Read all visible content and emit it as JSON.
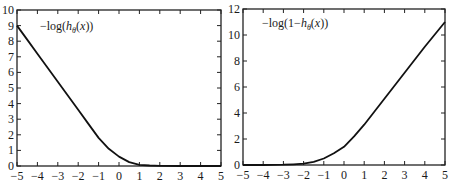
{
  "chart_data": [
    {
      "type": "line",
      "title": "",
      "legend": "-log(h_θ(x))",
      "legend_parts": {
        "pre": "−log(",
        "h": "h",
        "sub": "θ",
        "post": "(x))"
      },
      "xlabel": "",
      "ylabel": "",
      "xlim": [
        -5,
        5
      ],
      "ylim": [
        0,
        10
      ],
      "xticks": [
        -5,
        -4,
        -3,
        -2,
        -1,
        0,
        1,
        2,
        3,
        4,
        5
      ],
      "yticks": [
        0,
        1,
        2,
        3,
        4,
        5,
        6,
        7,
        8,
        9,
        10
      ],
      "grid": false,
      "x": [
        -5,
        -4.5,
        -4,
        -3.5,
        -3,
        -2.5,
        -2,
        -1.5,
        -1,
        -0.5,
        0,
        0.5,
        1,
        1.5,
        2,
        3,
        4,
        5
      ],
      "y": [
        9.0,
        8.1,
        7.2,
        6.3,
        5.4,
        4.5,
        3.6,
        2.7,
        1.8,
        1.1,
        0.6,
        0.25,
        0.08,
        0.03,
        0.01,
        0.0,
        0.0,
        0.0
      ]
    },
    {
      "type": "line",
      "title": "",
      "legend": "-log(1-h_θ(x))",
      "legend_parts": {
        "pre": "−log(1−",
        "h": "h",
        "sub": "θ",
        "post": "(x))"
      },
      "xlabel": "",
      "ylabel": "",
      "xlim": [
        -5,
        5
      ],
      "ylim": [
        0,
        12
      ],
      "xticks": [
        -5,
        -4,
        -3,
        -2,
        -1,
        0,
        1,
        2,
        3,
        4,
        5
      ],
      "yticks": [
        0,
        2,
        4,
        6,
        8,
        10,
        12
      ],
      "grid": false,
      "x": [
        -5,
        -4,
        -3,
        -2.5,
        -2,
        -1.5,
        -1,
        -0.5,
        0,
        0.5,
        1,
        1.5,
        2,
        3,
        4,
        5
      ],
      "y": [
        0.0,
        0.0,
        0.02,
        0.05,
        0.1,
        0.25,
        0.5,
        0.9,
        1.4,
        2.2,
        3.1,
        4.1,
        5.1,
        7.1,
        9.1,
        11.0
      ]
    }
  ]
}
